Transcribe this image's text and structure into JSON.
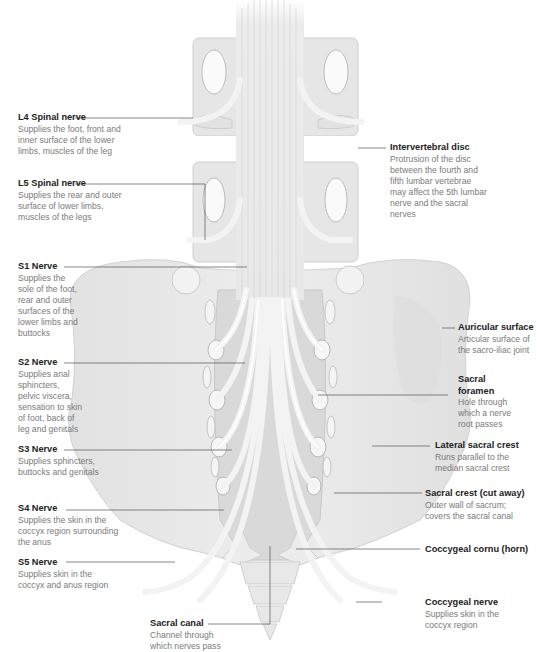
{
  "diagram": {
    "colors": {
      "bone": "#e9e9e9",
      "bone_shade": "#d6d6d6",
      "nerve": "#efefef",
      "canal": "#cfcfcf",
      "leader_line": "#555555",
      "title_text": "#222222",
      "desc_text": "#7a7a7a"
    }
  },
  "labels": {
    "left": [
      {
        "id": "l4",
        "title": "L4 Spinal nerve",
        "desc": "Supplies the foot, front and\ninner surface of the lower\nlimbs, muscles of the leg"
      },
      {
        "id": "l5",
        "title": "L5 Spinal nerve",
        "desc": "Supplies the rear and outer\nsurface of lower limbs,\nmuscles of the legs"
      },
      {
        "id": "s1",
        "title": "S1 Nerve",
        "desc": "Supplies the\nsole of the foot,\nrear and outer\nsurfaces of the\nlower limbs and\nbuttocks"
      },
      {
        "id": "s2",
        "title": "S2 Nerve",
        "desc": "Supplies anal\nsphincters,\npelvic viscera,\nsensation to skin\nof foot, back of\nleg and genitals"
      },
      {
        "id": "s3",
        "title": "S3 Nerve",
        "desc": "Supplies sphincters,\nbuttocks and genitals"
      },
      {
        "id": "s4",
        "title": "S4 Nerve",
        "desc": "Supplies the skin in the\ncoccyx region surrounding\nthe anus"
      },
      {
        "id": "s5",
        "title": "S5 Nerve",
        "desc": "Supplies skin in the\ncoccyx and anus region"
      }
    ],
    "bottom": [
      {
        "id": "sacral-canal",
        "title": "Sacral canal",
        "desc": "Channel through\nwhich nerves pass"
      }
    ],
    "right": [
      {
        "id": "intervertebral-disc",
        "title": "Intervertebral disc",
        "desc": "Protrusion of the disc\nbetween the fourth and\nfifth lumbar vertebrae\nmay affect the 5th lumbar\nnerve and the sacral\nnerves"
      },
      {
        "id": "auricular-surface",
        "title": "Auricular surface",
        "desc": "Articular surface of\nthe sacro-iliac joint"
      },
      {
        "id": "sacral-foramen",
        "title": "Sacral\nforamen",
        "desc": "Hole through\nwhich a nerve\nroot passes"
      },
      {
        "id": "lateral-sacral-crest",
        "title": "Lateral sacral crest",
        "desc": "Runs parallel to the\nmedian sacral crest"
      },
      {
        "id": "sacral-crest",
        "title": "Sacral crest (cut away)",
        "desc": "Outer wall of sacrum;\ncovers the sacral canal"
      },
      {
        "id": "coccygeal-cornu",
        "title": "Coccygeal cornu (horn)",
        "desc": ""
      },
      {
        "id": "coccygeal-nerve",
        "title": "Coccygeal nerve",
        "desc": "Supplies skin in the\ncoccyx region"
      }
    ]
  }
}
